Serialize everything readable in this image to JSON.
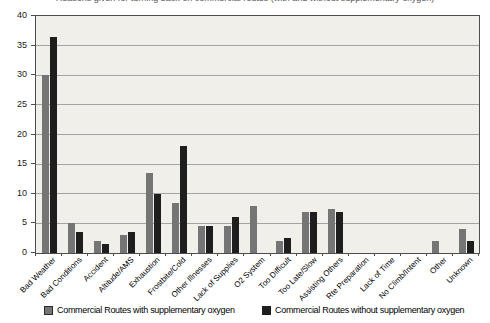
{
  "clipped_title": "Reasons given for turning back on commercial routes (with and without supplementary oxygen)",
  "chart_data": {
    "type": "bar",
    "categories": [
      "Bad Weather",
      "Bad Conditions",
      "Accident",
      "Altitude/AMS",
      "Exhaustion",
      "Frostbite/Cold",
      "Other Illnesses",
      "Lack of Supplies",
      "O2 System",
      "Too Difficult",
      "Too Late/Slow",
      "Assisting Others",
      "Rte Preparation",
      "Lack of Time",
      "No Climb/Intent",
      "Other",
      "Unknown"
    ],
    "series": [
      {
        "name": "Commercial Routes with supplementary oxygen",
        "color": "#757575",
        "values": [
          30,
          5,
          2,
          3,
          13.5,
          8.5,
          4.5,
          4.5,
          8,
          2,
          7,
          7.5,
          0,
          0,
          0,
          2,
          4
        ]
      },
      {
        "name": "Commercial Routes without supplementary oxygen",
        "color": "#1e1e1e",
        "values": [
          36.5,
          3.5,
          1.5,
          3.5,
          10,
          18,
          4.5,
          6,
          0,
          2.5,
          7,
          7,
          0,
          0,
          0,
          0,
          2
        ]
      }
    ],
    "title": "",
    "xlabel": "",
    "ylabel": "",
    "ylim": [
      0,
      40
    ],
    "ytick_step": 5,
    "grid": true,
    "legend_position": "bottom"
  },
  "colors": {
    "plot_bg": "#f0efea",
    "gridline": "#a3a3a3",
    "axis": "#4d4d4d",
    "with_o2_bar": "#757575",
    "without_o2_bar": "#1e1e1e"
  }
}
